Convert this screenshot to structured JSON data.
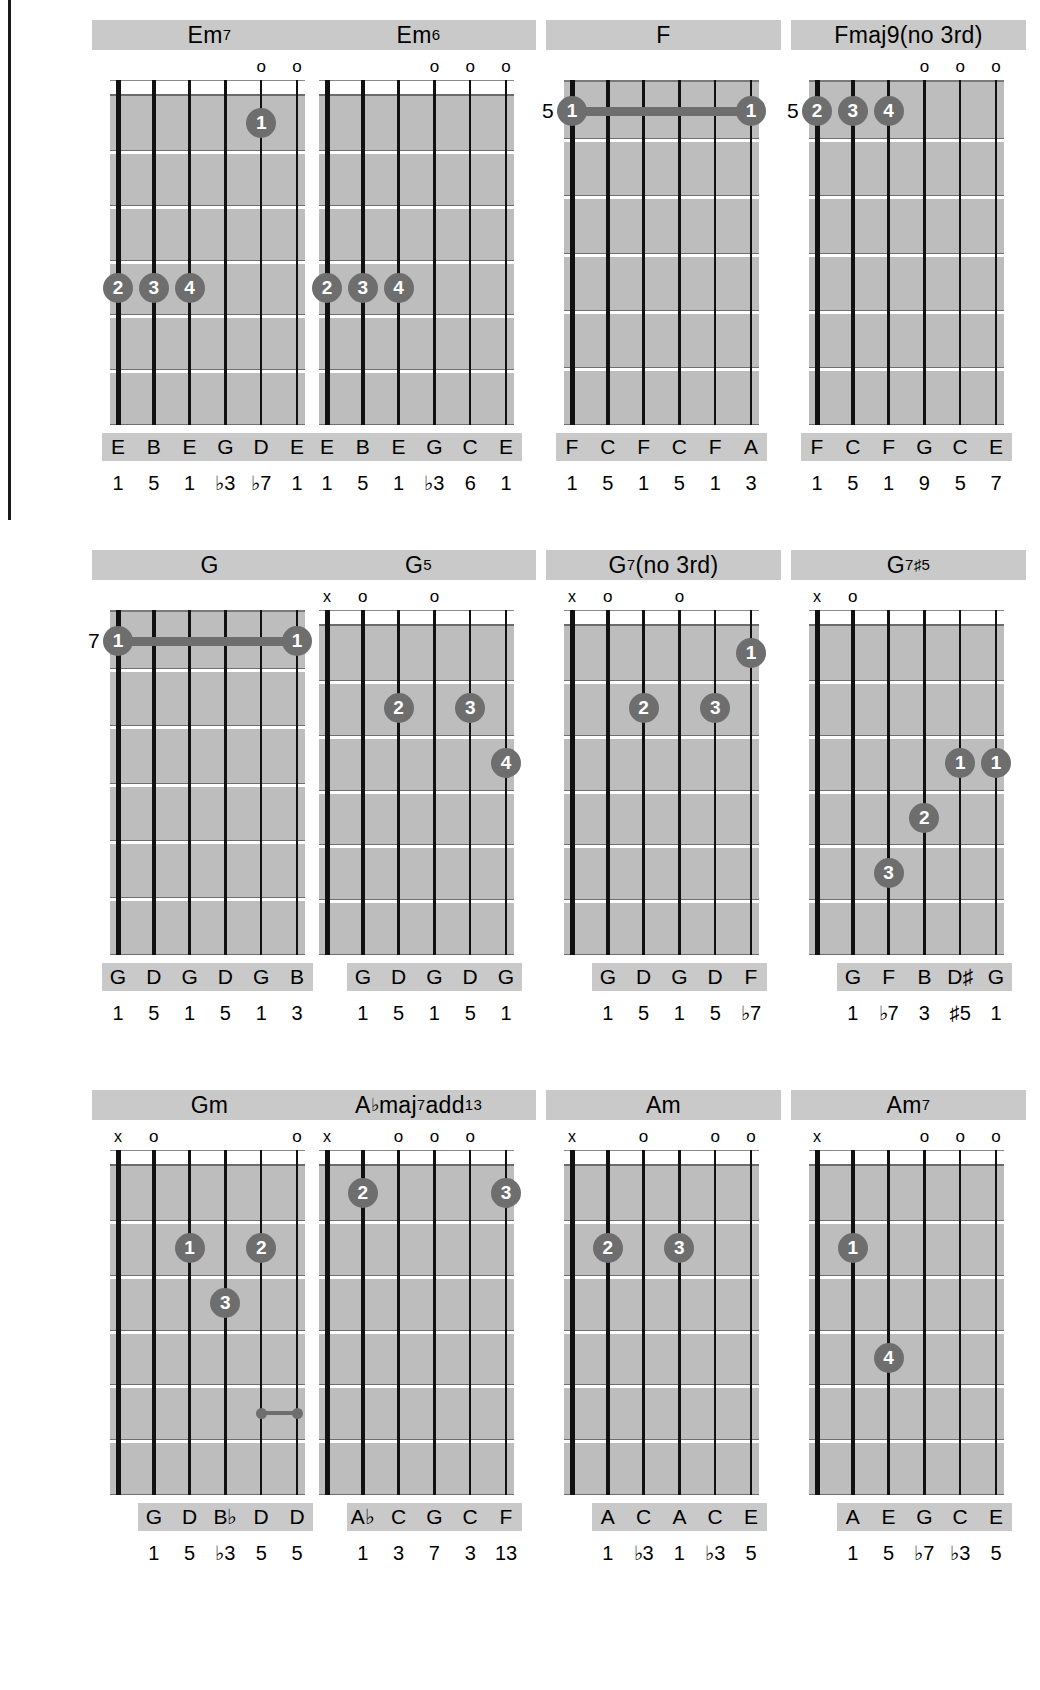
{
  "page": {
    "columns": 4,
    "rows": 3,
    "dot_color": "#6e6e6e",
    "board_color": "#bdbdbd",
    "label_bg": "#c9c9c9"
  },
  "diagrams": [
    {
      "name": "Em7",
      "title_parts": [
        {
          "t": "Em",
          "sup": false
        },
        {
          "t": "7",
          "sup": true
        }
      ],
      "strings": 6,
      "frets": 6,
      "show_nut": true,
      "position_label": "",
      "markers": [
        "",
        "",
        "",
        "",
        "o",
        "o"
      ],
      "notes": [
        "E",
        "B",
        "E",
        "G",
        "D",
        "E"
      ],
      "intervals": [
        "1",
        "5",
        "1",
        "♭3",
        "♭7",
        "1"
      ],
      "dots": [
        {
          "finger": "1",
          "string": 5,
          "fret": 1
        },
        {
          "finger": "2",
          "string": 1,
          "fret": 4
        },
        {
          "finger": "3",
          "string": 2,
          "fret": 4
        },
        {
          "finger": "4",
          "string": 3,
          "fret": 4
        }
      ],
      "barres": []
    },
    {
      "name": "Em6",
      "title_parts": [
        {
          "t": "Em",
          "sup": false
        },
        {
          "t": "6",
          "sup": true
        }
      ],
      "strings": 6,
      "frets": 6,
      "show_nut": true,
      "position_label": "",
      "markers": [
        "",
        "",
        "",
        "o",
        "o",
        "o"
      ],
      "notes": [
        "E",
        "B",
        "E",
        "G",
        "C",
        "E"
      ],
      "intervals": [
        "1",
        "5",
        "1",
        "♭3",
        "6",
        "1"
      ],
      "dots": [
        {
          "finger": "2",
          "string": 1,
          "fret": 4
        },
        {
          "finger": "3",
          "string": 2,
          "fret": 4
        },
        {
          "finger": "4",
          "string": 3,
          "fret": 4
        }
      ],
      "barres": []
    },
    {
      "name": "F",
      "title_parts": [
        {
          "t": "F",
          "sup": false
        }
      ],
      "strings": 6,
      "frets": 6,
      "show_nut": false,
      "position_label": "5",
      "position_fret": 1,
      "markers": [
        "",
        "",
        "",
        "",
        "",
        ""
      ],
      "notes": [
        "F",
        "C",
        "F",
        "C",
        "F",
        "A"
      ],
      "intervals": [
        "1",
        "5",
        "1",
        "5",
        "1",
        "3"
      ],
      "dots": [
        {
          "finger": "1",
          "string": 1,
          "fret": 1
        },
        {
          "finger": "1",
          "string": 6,
          "fret": 1
        }
      ],
      "barres": [
        {
          "from": 1,
          "to": 6,
          "fret": 1
        }
      ]
    },
    {
      "name": "Fmaj9(no 3rd)",
      "title_parts": [
        {
          "t": "Fmaj9(no 3rd)",
          "sup": false
        }
      ],
      "strings": 6,
      "frets": 6,
      "show_nut": false,
      "position_label": "5",
      "position_fret": 1,
      "markers": [
        "",
        "",
        "",
        "o",
        "o",
        "o"
      ],
      "notes": [
        "F",
        "C",
        "F",
        "G",
        "C",
        "E"
      ],
      "intervals": [
        "1",
        "5",
        "1",
        "9",
        "5",
        "7"
      ],
      "dots": [
        {
          "finger": "2",
          "string": 1,
          "fret": 1
        },
        {
          "finger": "3",
          "string": 2,
          "fret": 1
        },
        {
          "finger": "4",
          "string": 3,
          "fret": 1
        }
      ],
      "barres": []
    },
    {
      "name": "G",
      "title_parts": [
        {
          "t": "G",
          "sup": false
        }
      ],
      "strings": 6,
      "frets": 6,
      "show_nut": false,
      "position_label": "7",
      "position_fret": 1,
      "markers": [
        "",
        "",
        "",
        "",
        "",
        ""
      ],
      "notes": [
        "G",
        "D",
        "G",
        "D",
        "G",
        "B"
      ],
      "intervals": [
        "1",
        "5",
        "1",
        "5",
        "1",
        "3"
      ],
      "dots": [
        {
          "finger": "1",
          "string": 1,
          "fret": 1
        },
        {
          "finger": "1",
          "string": 6,
          "fret": 1
        }
      ],
      "barres": [
        {
          "from": 1,
          "to": 6,
          "fret": 1
        }
      ]
    },
    {
      "name": "G5",
      "title_parts": [
        {
          "t": "G",
          "sup": false
        },
        {
          "t": "5",
          "sup": true
        }
      ],
      "strings": 6,
      "frets": 6,
      "show_nut": true,
      "position_label": "",
      "markers": [
        "x",
        "o",
        "",
        "o",
        "",
        ""
      ],
      "notes": [
        "",
        "G",
        "D",
        "G",
        "D",
        "G"
      ],
      "intervals": [
        "",
        "1",
        "5",
        "1",
        "5",
        "1"
      ],
      "dots": [
        {
          "finger": "2",
          "string": 3,
          "fret": 2
        },
        {
          "finger": "3",
          "string": 5,
          "fret": 2
        },
        {
          "finger": "4",
          "string": 6,
          "fret": 3
        }
      ],
      "barres": []
    },
    {
      "name": "G7(no 3rd)",
      "title_parts": [
        {
          "t": "G",
          "sup": false
        },
        {
          "t": "7",
          "sup": true
        },
        {
          "t": "(no 3rd)",
          "sup": false
        }
      ],
      "strings": 6,
      "frets": 6,
      "show_nut": true,
      "position_label": "",
      "markers": [
        "x",
        "o",
        "",
        "o",
        "",
        ""
      ],
      "notes": [
        "",
        "G",
        "D",
        "G",
        "D",
        "F"
      ],
      "intervals": [
        "",
        "1",
        "5",
        "1",
        "5",
        "♭7"
      ],
      "dots": [
        {
          "finger": "1",
          "string": 6,
          "fret": 1
        },
        {
          "finger": "2",
          "string": 3,
          "fret": 2
        },
        {
          "finger": "3",
          "string": 5,
          "fret": 2
        }
      ],
      "barres": []
    },
    {
      "name": "G7#5",
      "title_parts": [
        {
          "t": "G",
          "sup": false
        },
        {
          "t": "7",
          "sup": true
        },
        {
          "t": "♯5",
          "sup": true
        }
      ],
      "strings": 6,
      "frets": 6,
      "show_nut": true,
      "position_label": "",
      "markers": [
        "x",
        "o",
        "",
        "",
        "",
        ""
      ],
      "notes": [
        "",
        "G",
        "F",
        "B",
        "D♯",
        "G"
      ],
      "intervals": [
        "",
        "1",
        "♭7",
        "3",
        "♯5",
        "1"
      ],
      "dots": [
        {
          "finger": "1",
          "string": 5,
          "fret": 3
        },
        {
          "finger": "1",
          "string": 6,
          "fret": 3
        },
        {
          "finger": "2",
          "string": 4,
          "fret": 4
        },
        {
          "finger": "3",
          "string": 3,
          "fret": 5
        }
      ],
      "barres": []
    },
    {
      "name": "Gm",
      "title_parts": [
        {
          "t": "Gm",
          "sup": false
        }
      ],
      "strings": 6,
      "frets": 6,
      "show_nut": true,
      "position_label": "",
      "markers": [
        "x",
        "o",
        "",
        "",
        "",
        "o"
      ],
      "notes": [
        "",
        "G",
        "D",
        "B♭",
        "D",
        "D"
      ],
      "intervals": [
        "",
        "1",
        "5",
        "♭3",
        "5",
        "5"
      ],
      "dots": [
        {
          "finger": "1",
          "string": 3,
          "fret": 2
        },
        {
          "finger": "2",
          "string": 5,
          "fret": 2
        },
        {
          "finger": "3",
          "string": 4,
          "fret": 3
        }
      ],
      "barres": [],
      "minibar": {
        "from": 5,
        "to": 6,
        "fret": 5
      }
    },
    {
      "name": "Abmaj7add13",
      "title_parts": [
        {
          "t": "A",
          "sup": false
        },
        {
          "t": "♭",
          "sup": false,
          "acc": true
        },
        {
          "t": "maj",
          "sup": false
        },
        {
          "t": "7",
          "sup": true
        },
        {
          "t": "add",
          "sup": false
        },
        {
          "t": "13",
          "sup": true
        }
      ],
      "strings": 6,
      "frets": 6,
      "show_nut": true,
      "position_label": "",
      "markers": [
        "x",
        "",
        "o",
        "o",
        "o",
        ""
      ],
      "notes": [
        "",
        "A♭",
        "C",
        "G",
        "C",
        "F"
      ],
      "intervals": [
        "",
        "1",
        "3",
        "7",
        "3",
        "13"
      ],
      "dots": [
        {
          "finger": "2",
          "string": 2,
          "fret": 1
        },
        {
          "finger": "3",
          "string": 6,
          "fret": 1
        }
      ],
      "barres": []
    },
    {
      "name": "Am",
      "title_parts": [
        {
          "t": "Am",
          "sup": false
        }
      ],
      "strings": 6,
      "frets": 6,
      "show_nut": true,
      "position_label": "",
      "markers": [
        "x",
        "",
        "o",
        "",
        "o",
        "o"
      ],
      "notes": [
        "",
        "A",
        "C",
        "A",
        "C",
        "E"
      ],
      "intervals": [
        "",
        "1",
        "♭3",
        "1",
        "♭3",
        "5"
      ],
      "dots": [
        {
          "finger": "2",
          "string": 2,
          "fret": 2
        },
        {
          "finger": "3",
          "string": 4,
          "fret": 2
        }
      ],
      "barres": []
    },
    {
      "name": "Am7",
      "title_parts": [
        {
          "t": "Am",
          "sup": false
        },
        {
          "t": "7",
          "sup": true
        }
      ],
      "strings": 6,
      "frets": 6,
      "show_nut": true,
      "position_label": "",
      "markers": [
        "x",
        "",
        "",
        "o",
        "o",
        "o"
      ],
      "notes": [
        "",
        "A",
        "E",
        "G",
        "C",
        "E"
      ],
      "intervals": [
        "",
        "1",
        "5",
        "♭7",
        "♭3",
        "5"
      ],
      "dots": [
        {
          "finger": "1",
          "string": 2,
          "fret": 2
        },
        {
          "finger": "4",
          "string": 3,
          "fret": 4
        }
      ],
      "barres": []
    }
  ]
}
